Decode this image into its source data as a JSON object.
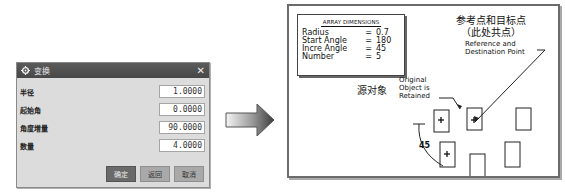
{
  "dialog": {
    "title": "变换",
    "close": "✕",
    "fields": [
      {
        "label": "半径",
        "value": "1.0000"
      },
      {
        "label": "起始角",
        "value": "0.0000"
      },
      {
        "label": "角度增量",
        "value": "90.0000"
      },
      {
        "label": "数量",
        "value": "4.0000"
      }
    ],
    "buttons": {
      "ok": "确定",
      "back": "返回",
      "cancel": "取消"
    }
  },
  "figure": {
    "dims_title": "ARRAY DIMENSIONS",
    "dims": [
      {
        "name": "Radius",
        "eq": "=",
        "value": "0.7"
      },
      {
        "name": "Start Angle",
        "eq": "=",
        "value": "180"
      },
      {
        "name": "Incre Angle",
        "eq": "=",
        "value": "45"
      },
      {
        "name": "Number",
        "eq": "=",
        "value": "5"
      }
    ],
    "ref_cn_line1": "参考点和目标点",
    "ref_cn_line2": "（此处共点）",
    "ref_en_line1": "Reference and",
    "ref_en_line2": "Destination Point",
    "src_cn": "源对象",
    "orig_en_line1": "Original",
    "orig_en_line2": "Object is",
    "orig_en_line3": "Retained",
    "angle_label": "45"
  },
  "icons": {
    "arrow": "right-arrow-icon",
    "gear": "gear-icon"
  }
}
